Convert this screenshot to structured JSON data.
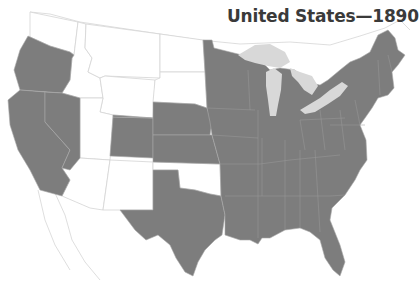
{
  "map": {
    "title": "United States—1890",
    "colors": {
      "states": "#7d7d7d",
      "territories": "#ffffff",
      "lakes": "#d8d8d8",
      "title": "#3a3a3a"
    },
    "legend_meaning": {
      "shaded": "States admitted by 1890",
      "unshaded": "Territories / not yet states"
    },
    "shaded_regions": [
      "Oregon",
      "California",
      "Nevada",
      "Colorado",
      "Nebraska",
      "Kansas",
      "Texas",
      "Minnesota",
      "Iowa",
      "Missouri",
      "Arkansas",
      "Louisiana",
      "Wisconsin",
      "Illinois",
      "Michigan",
      "Indiana",
      "Ohio",
      "Kentucky",
      "Tennessee",
      "Mississippi",
      "Alabama",
      "Georgia",
      "Florida",
      "South Carolina",
      "North Carolina",
      "Virginia",
      "West Virginia",
      "Maryland",
      "Delaware",
      "New Jersey",
      "Pennsylvania",
      "New York",
      "Connecticut",
      "Rhode Island",
      "Massachusetts",
      "Vermont",
      "New Hampshire",
      "Maine"
    ],
    "unshaded_regions": [
      "Washington",
      "Idaho",
      "Montana",
      "Wyoming",
      "North Dakota",
      "South Dakota",
      "Utah",
      "Arizona",
      "New Mexico",
      "Oklahoma / Indian Territory"
    ]
  }
}
